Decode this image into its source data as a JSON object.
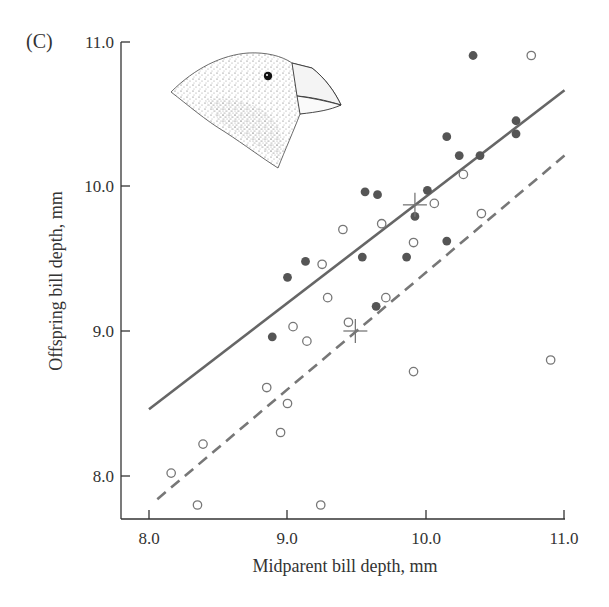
{
  "figure": {
    "panel_label": "(C)",
    "illustration": "medium ground finch head (Geospiza fortis) stippled drawing"
  },
  "chart_data": {
    "type": "scatter",
    "title": "",
    "panel_label": "(C)",
    "xlabel": "Midparent bill depth, mm",
    "ylabel": "Offspring bill depth, mm",
    "xlim": [
      7.8,
      11.0
    ],
    "ylim": [
      7.7,
      11.0
    ],
    "x_ticks": [
      "8.0",
      "9.0",
      "10.0",
      "11.0"
    ],
    "y_ticks": [
      "8.0",
      "9.0",
      "10.0",
      "11.0"
    ],
    "grid": false,
    "legend": null,
    "series": [
      {
        "name": "filled",
        "marker": "filled-circle",
        "color": "#555555",
        "points": [
          [
            10.34,
            10.9
          ],
          [
            10.15,
            10.34
          ],
          [
            10.65,
            10.45
          ],
          [
            10.65,
            10.36
          ],
          [
            10.24,
            10.21
          ],
          [
            10.39,
            10.21
          ],
          [
            10.01,
            9.97
          ],
          [
            9.56,
            9.96
          ],
          [
            9.65,
            9.94
          ],
          [
            9.92,
            9.79
          ],
          [
            10.15,
            9.62
          ],
          [
            9.54,
            9.51
          ],
          [
            9.86,
            9.51
          ],
          [
            9.13,
            9.48
          ],
          [
            9.0,
            9.37
          ],
          [
            9.64,
            9.17
          ],
          [
            8.89,
            8.96
          ]
        ],
        "mean": [
          9.92,
          9.87
        ],
        "fit_line": {
          "style": "solid",
          "x": [
            8.0,
            11.0
          ],
          "y": [
            8.46,
            10.66
          ]
        }
      },
      {
        "name": "open",
        "marker": "open-circle",
        "color": "#777777",
        "points": [
          [
            10.76,
            10.9
          ],
          [
            10.27,
            10.08
          ],
          [
            10.06,
            9.88
          ],
          [
            10.4,
            9.81
          ],
          [
            9.4,
            9.7
          ],
          [
            9.68,
            9.74
          ],
          [
            9.91,
            9.61
          ],
          [
            9.25,
            9.46
          ],
          [
            9.29,
            9.23
          ],
          [
            9.71,
            9.23
          ],
          [
            9.44,
            9.06
          ],
          [
            9.04,
            9.03
          ],
          [
            9.14,
            8.93
          ],
          [
            10.9,
            8.8
          ],
          [
            9.91,
            8.72
          ],
          [
            8.85,
            8.61
          ],
          [
            9.0,
            8.5
          ],
          [
            8.95,
            8.3
          ],
          [
            8.39,
            8.22
          ],
          [
            8.16,
            8.02
          ],
          [
            8.35,
            7.8
          ],
          [
            9.24,
            7.8
          ]
        ],
        "mean": [
          9.49,
          9.0
        ],
        "fit_line": {
          "style": "dashed",
          "x": [
            8.06,
            11.0
          ],
          "y": [
            7.84,
            10.21
          ]
        }
      }
    ],
    "colors": {
      "axis": "#333333",
      "solid_line": "#666666",
      "dashed_line": "#777777",
      "mean_cross": "#777777"
    }
  }
}
